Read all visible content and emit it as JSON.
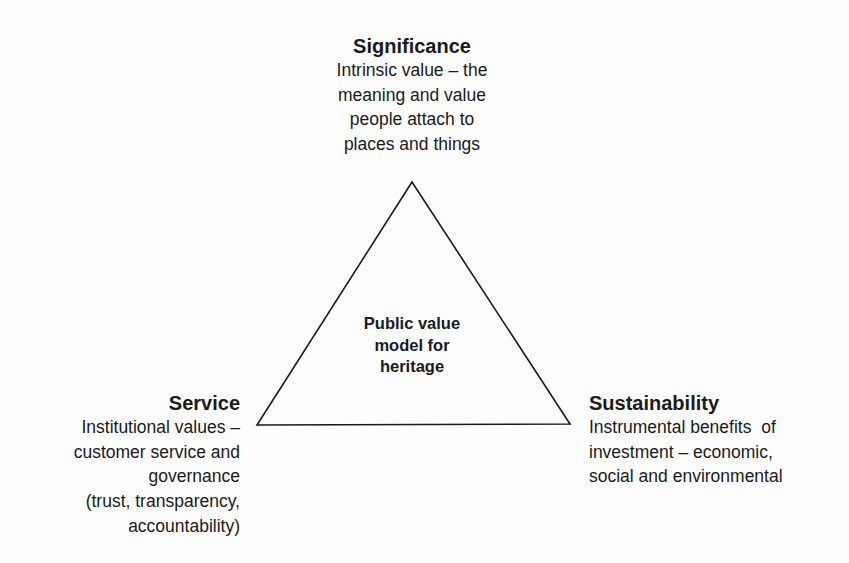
{
  "diagram": {
    "type": "triangle",
    "center_label": [
      "Public value",
      "model for",
      "heritage"
    ],
    "stroke_color": "#1a1a1a",
    "background_color": "#fdfdfd",
    "vertices": {
      "top": {
        "title": "Significance",
        "lines": [
          "Intrinsic value – the",
          "meaning and value",
          "people attach to",
          "places and things"
        ]
      },
      "bottom_left": {
        "title": "Service",
        "lines": [
          "Institutional values –",
          "customer service and",
          "governance",
          "(trust, transparency,",
          "accountability)"
        ]
      },
      "bottom_right": {
        "title": "Sustainability",
        "lines": [
          "Instrumental benefits  of",
          "investment – economic,",
          "social and environmental"
        ]
      }
    }
  }
}
